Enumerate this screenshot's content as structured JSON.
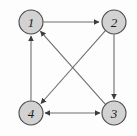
{
  "figure": {
    "background_color": "#fdfdfd",
    "node_fill_color": "#d2d2d2",
    "node_stroke_color": "#4a4a4a",
    "edge_color": "#6e6e6e",
    "arrow_color": "#3c3c3c"
  },
  "nodes": [
    {
      "id": "1",
      "label": "1",
      "x": 31,
      "y": 22,
      "r": 12
    },
    {
      "id": "2",
      "label": "2",
      "x": 114,
      "y": 22,
      "r": 12
    },
    {
      "id": "3",
      "label": "3",
      "x": 114,
      "y": 113,
      "r": 12
    },
    {
      "id": "4",
      "label": "4",
      "x": 31,
      "y": 113,
      "r": 12
    }
  ],
  "edges": [
    {
      "id": "e-1-2",
      "from": "1",
      "to": "2",
      "directed": "one-way",
      "shape": "straight",
      "description": "top horizontal edge from vertex 1 to vertex 2"
    },
    {
      "id": "e-2-3",
      "from": "2",
      "to": "3",
      "directed": "one-way",
      "shape": "straight",
      "description": "right vertical edge from vertex 2 to vertex 3"
    },
    {
      "id": "e-4-1",
      "from": "4",
      "to": "1",
      "directed": "one-way",
      "shape": "straight",
      "description": "left vertical edge from vertex 4 to vertex 1"
    },
    {
      "id": "e-2-4",
      "from": "2",
      "to": "4",
      "directed": "one-way",
      "shape": "diagonal",
      "description": "diagonal edge from vertex 2 down-left to vertex 4"
    },
    {
      "id": "e-3-1",
      "from": "3",
      "to": "1",
      "directed": "one-way",
      "shape": "diagonal",
      "description": "diagonal edge from vertex 3 up-left to vertex 1"
    },
    {
      "id": "e-4-3",
      "from": "4",
      "to": "3",
      "directed": "two-way",
      "shape": "straight",
      "description": "bottom horizontal edge between vertex 4 and vertex 3, arrowheads at both ends"
    }
  ]
}
